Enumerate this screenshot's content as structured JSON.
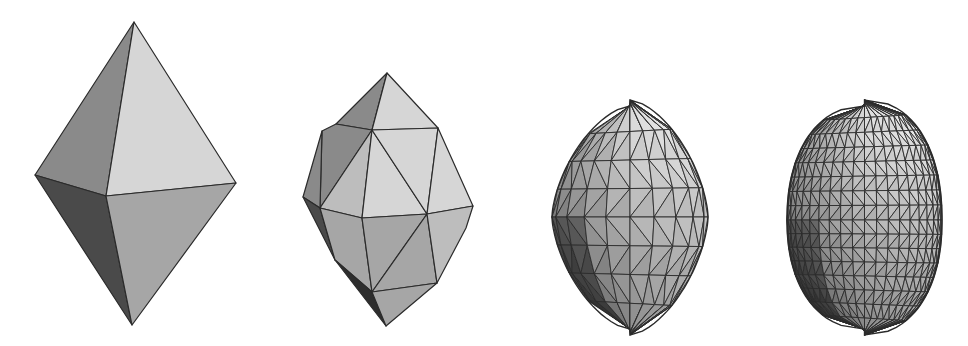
{
  "figure": {
    "description": "Successive subdivision of an octahedron toward a rounded (superellipsoid-like) surface",
    "background": "#ffffff",
    "edge_color": "#2b2b2b",
    "shades": {
      "light": "#d6d6d6",
      "mid_light": "#bdbdbd",
      "mid": "#a6a6a6",
      "mid_dark": "#8a8a8a",
      "dark": "#4a4a4a",
      "darkest": "#2e2e2e"
    },
    "panels": [
      {
        "name": "octahedron",
        "level": 0,
        "bbox": {
          "left": 35,
          "top": 22,
          "right": 236,
          "bottom": 325
        },
        "vertices": {
          "top": [
            134,
            22
          ],
          "left": [
            35,
            175
          ],
          "front": [
            106,
            196
          ],
          "right": [
            236,
            183
          ],
          "bottom": [
            132,
            325
          ]
        },
        "faces": [
          {
            "pts": [
              "top",
              "left",
              "front"
            ],
            "shade": "mid_dark"
          },
          {
            "pts": [
              "top",
              "front",
              "right"
            ],
            "shade": "light"
          },
          {
            "pts": [
              "left",
              "front",
              "bottom"
            ],
            "shade": "dark"
          },
          {
            "pts": [
              "front",
              "right",
              "bottom"
            ],
            "shade": "mid"
          }
        ]
      },
      {
        "name": "subdivision-level-1",
        "level": 1,
        "bbox": {
          "left": 303,
          "top": 73,
          "right": 474,
          "bottom": 326
        },
        "vertices": {
          "top": [
            387,
            73
          ],
          "u1": [
            336,
            124
          ],
          "u2": [
            372,
            130
          ],
          "u3": [
            438,
            128
          ],
          "u0": [
            322,
            131
          ],
          "m0": [
            303,
            197
          ],
          "m1": [
            320,
            208
          ],
          "m2": [
            362,
            218
          ],
          "m3": [
            427,
            214
          ],
          "m4": [
            473,
            206
          ],
          "l0": [
            335,
            260
          ],
          "l1": [
            372,
            292
          ],
          "l2": [
            437,
            283
          ],
          "l3": [
            466,
            228
          ],
          "bottom": [
            386,
            326
          ]
        },
        "faces": [
          {
            "pts": [
              "top",
              "u1",
              "u2"
            ],
            "shade": "mid_dark"
          },
          {
            "pts": [
              "top",
              "u2",
              "u3"
            ],
            "shade": "light"
          },
          {
            "pts": [
              "u1",
              "u0",
              "m1",
              "u2"
            ],
            "shade": "mid_dark"
          },
          {
            "pts": [
              "u0",
              "m0",
              "m1"
            ],
            "shade": "mid_dark"
          },
          {
            "pts": [
              "u2",
              "m1",
              "m2"
            ],
            "shade": "mid_light"
          },
          {
            "pts": [
              "u2",
              "m2",
              "m3"
            ],
            "shade": "light"
          },
          {
            "pts": [
              "u2",
              "m3",
              "u3"
            ],
            "shade": "light"
          },
          {
            "pts": [
              "u3",
              "m3",
              "m4"
            ],
            "shade": "light"
          },
          {
            "pts": [
              "m0",
              "m1",
              "l0"
            ],
            "shade": "dark"
          },
          {
            "pts": [
              "m1",
              "m2",
              "l1",
              "l0"
            ],
            "shade": "mid"
          },
          {
            "pts": [
              "m2",
              "m3",
              "l1"
            ],
            "shade": "mid"
          },
          {
            "pts": [
              "m3",
              "l2",
              "l1"
            ],
            "shade": "mid"
          },
          {
            "pts": [
              "m3",
              "m4",
              "l3",
              "l2"
            ],
            "shade": "mid_light"
          },
          {
            "pts": [
              "l0",
              "l1",
              "bottom"
            ],
            "shade": "darkest"
          },
          {
            "pts": [
              "l1",
              "l2",
              "bottom"
            ],
            "shade": "mid"
          }
        ]
      },
      {
        "name": "subdivision-level-2",
        "level": 2,
        "bbox": {
          "left": 552,
          "top": 103,
          "right": 708,
          "bottom": 332
        },
        "outline": {
          "cx": 630,
          "top": 103,
          "bottom": 332,
          "left": 552,
          "right": 708,
          "mid_y": 217
        },
        "grid": {
          "rings": 8,
          "segments": 10
        }
      },
      {
        "name": "subdivision-level-3",
        "level": 3,
        "bbox": {
          "left": 787,
          "top": 103,
          "right": 942,
          "bottom": 332
        },
        "outline": {
          "cx": 865,
          "top": 103,
          "bottom": 332,
          "left": 787,
          "right": 942,
          "mid_y": 220
        },
        "grid": {
          "rings": 16,
          "segments": 20
        }
      }
    ]
  }
}
